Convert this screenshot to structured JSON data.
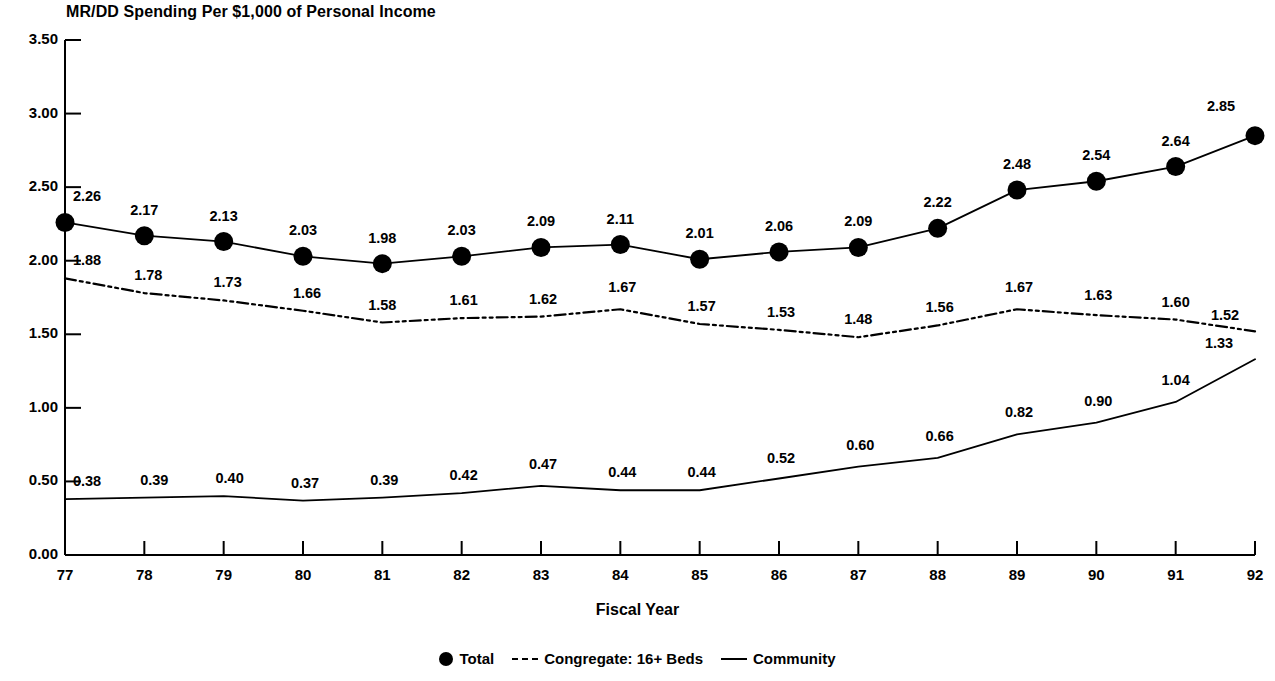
{
  "chart_data": {
    "type": "line",
    "title": "MR/DD Spending Per $1,000 of Personal Income",
    "xlabel": "Fiscal Year",
    "ylabel": "",
    "grid": false,
    "legend_position": "bottom",
    "xlim": [
      77,
      92
    ],
    "ylim": [
      0.0,
      3.5
    ],
    "ytick_labels": [
      "0.00",
      "0.50",
      "1.00",
      "1.50",
      "2.00",
      "2.50",
      "3.00",
      "3.50"
    ],
    "ytick_values": [
      0.0,
      0.5,
      1.0,
      1.5,
      2.0,
      2.5,
      3.0,
      3.5
    ],
    "categories": [
      "77",
      "78",
      "79",
      "80",
      "81",
      "82",
      "83",
      "84",
      "85",
      "86",
      "87",
      "88",
      "89",
      "90",
      "91",
      "92"
    ],
    "series": [
      {
        "name": "Total",
        "marker": "filled-circle",
        "line_style": "solid",
        "values": [
          2.26,
          2.17,
          2.13,
          2.03,
          1.98,
          2.03,
          2.09,
          2.11,
          2.01,
          2.06,
          2.09,
          2.22,
          2.48,
          2.54,
          2.64,
          2.85
        ],
        "labels": [
          "2.26",
          "2.17",
          "2.13",
          "2.03",
          "1.98",
          "2.03",
          "2.09",
          "2.11",
          "2.01",
          "2.06",
          "2.09",
          "2.22",
          "2.48",
          "2.54",
          "2.64",
          "2.85"
        ]
      },
      {
        "name": "Congregate: 16+ Beds",
        "marker": "none",
        "line_style": "dash-dot",
        "values": [
          1.88,
          1.78,
          1.73,
          1.66,
          1.58,
          1.61,
          1.62,
          1.67,
          1.57,
          1.53,
          1.48,
          1.56,
          1.67,
          1.63,
          1.6,
          1.52
        ],
        "labels": [
          "1.88",
          "1.78",
          "1.73",
          "1.66",
          "1.58",
          "1.61",
          "1.62",
          "1.67",
          "1.57",
          "1.53",
          "1.48",
          "1.56",
          "1.67",
          "1.63",
          "1.60",
          "1.52"
        ]
      },
      {
        "name": "Community",
        "marker": "none",
        "line_style": "solid",
        "values": [
          0.38,
          0.39,
          0.4,
          0.37,
          0.39,
          0.42,
          0.47,
          0.44,
          0.44,
          0.52,
          0.6,
          0.66,
          0.82,
          0.9,
          1.04,
          1.33
        ],
        "labels": [
          "0.38",
          "0.39",
          "0.40",
          "0.37",
          "0.39",
          "0.42",
          "0.47",
          "0.44",
          "0.44",
          "0.52",
          "0.60",
          "0.66",
          "0.82",
          "0.90",
          "1.04",
          "1.33"
        ]
      }
    ],
    "colors": {
      "ink": "#000000",
      "background": "#ffffff"
    }
  }
}
